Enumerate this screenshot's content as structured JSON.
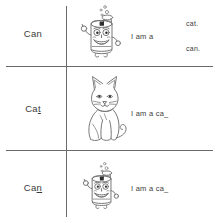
{
  "worksheet": {
    "rows": [
      {
        "word": "Can",
        "word_underlined": "",
        "illustration": "cartoon-can-character",
        "sentence": "I am a",
        "branches": [
          "cat.",
          "can."
        ]
      },
      {
        "word": "Ca",
        "word_underlined": "t",
        "illustration": "sitting-cat-drawing",
        "sentence": "I am a ca_",
        "branches": []
      },
      {
        "word": "Ca",
        "word_underlined": "n",
        "illustration": "cartoon-can-character",
        "sentence": "I am a ca_",
        "branches": []
      }
    ]
  },
  "colors": {
    "rule": "#6a6a6a",
    "text": "#3c3c3c",
    "line_art": "#777777"
  }
}
